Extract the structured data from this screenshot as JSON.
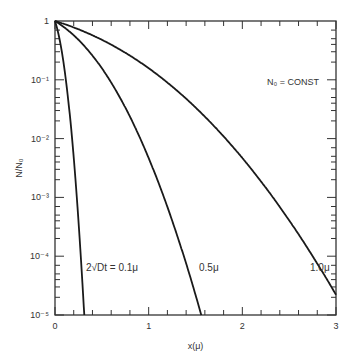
{
  "chart_data": {
    "type": "line",
    "title": "",
    "xlabel": "x(μ)",
    "ylabel": "N/N₀",
    "xscale": "linear",
    "yscale": "log",
    "xlim": [
      0,
      3
    ],
    "ylim": [
      1e-05,
      1
    ],
    "x_ticks": [
      "0",
      "1",
      "2",
      "3"
    ],
    "y_ticks": [
      "1",
      "10⁻¹",
      "10⁻²",
      "10⁻³",
      "10⁻⁴",
      "10⁻⁵"
    ],
    "grid": false,
    "annotation": "N₀ = CONST",
    "series": [
      {
        "name": "2√Dt = 0.1μ",
        "label": "2√Dt = 0.1μ",
        "diffusion_length": 0.1,
        "x": [
          0,
          0.05,
          0.1,
          0.15,
          0.2,
          0.25,
          0.3,
          0.31
        ],
        "y": [
          1,
          0.48,
          0.157,
          0.034,
          0.0047,
          0.00041,
          2.2e-05,
          1.2e-05
        ]
      },
      {
        "name": "0.5μ",
        "label": "0.5μ",
        "diffusion_length": 0.5,
        "x": [
          0,
          0.25,
          0.5,
          0.75,
          1.0,
          1.25,
          1.5,
          1.56
        ],
        "y": [
          1,
          0.48,
          0.157,
          0.034,
          0.0047,
          0.00041,
          2.2e-05,
          1e-05
        ]
      },
      {
        "name": "1.0μ",
        "label": "1.0μ",
        "diffusion_length": 1.0,
        "x": [
          0,
          0.5,
          1.0,
          1.5,
          2.0,
          2.5,
          3.0
        ],
        "y": [
          1,
          0.48,
          0.157,
          0.034,
          0.0047,
          0.00041,
          2.2e-05
        ]
      }
    ]
  }
}
